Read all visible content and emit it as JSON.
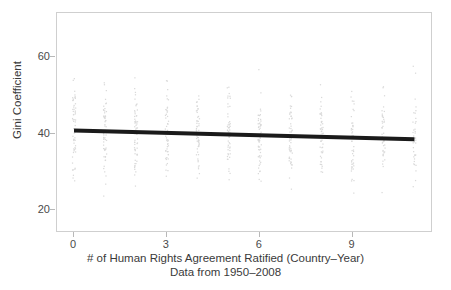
{
  "chart_data": {
    "type": "scatter",
    "title": "",
    "xlabel": "# of Human Rights Agreement Ratified (Country–Year)",
    "sublabel": "Data from 1950–2008",
    "ylabel": "Gini Coefficient",
    "xlim": [
      -0.55,
      11.6
    ],
    "ylim": [
      14.0,
      71.5
    ],
    "grid": false,
    "legend": false,
    "xticks": [
      0,
      3,
      6,
      9
    ],
    "xtick_labels": [
      "0",
      "3",
      "6",
      "9"
    ],
    "yticks": [
      20,
      40,
      60
    ],
    "ytick_labels": [
      "20",
      "40",
      "60"
    ],
    "point_color": "#d9d9d9",
    "line_color": "#1a1a1a",
    "frame_color": "#cfcfcf",
    "background": "#ffffff",
    "fit_line": {
      "name": "linear fit",
      "x": [
        0,
        11
      ],
      "y": [
        40.8,
        38.5
      ],
      "intercept": 40.8,
      "slope": -0.209,
      "width_px": 4
    },
    "series": [
      {
        "name": "Country-Year observations",
        "description": "Jittered vertical strips of observations at each integer count of ratified agreements",
        "columns": [
          {
            "x": 0,
            "n": 58,
            "y_min": 23.0,
            "y_max": 63.0,
            "y_median": 40.0,
            "y_q1": 33.0,
            "y_q3": 47.0
          },
          {
            "x": 1,
            "n": 62,
            "y_min": 22.0,
            "y_max": 62.5,
            "y_median": 40.0,
            "y_q1": 33.0,
            "y_q3": 47.0
          },
          {
            "x": 2,
            "n": 60,
            "y_min": 22.5,
            "y_max": 63.0,
            "y_median": 40.0,
            "y_q1": 33.0,
            "y_q3": 47.0
          },
          {
            "x": 3,
            "n": 55,
            "y_min": 17.5,
            "y_max": 60.5,
            "y_median": 39.5,
            "y_q1": 32.5,
            "y_q3": 46.5
          },
          {
            "x": 4,
            "n": 57,
            "y_min": 25.0,
            "y_max": 71.0,
            "y_median": 39.5,
            "y_q1": 32.5,
            "y_q3": 46.0
          },
          {
            "x": 5,
            "n": 54,
            "y_min": 20.5,
            "y_max": 62.0,
            "y_median": 39.5,
            "y_q1": 32.0,
            "y_q3": 46.0
          },
          {
            "x": 6,
            "n": 59,
            "y_min": 23.0,
            "y_max": 62.5,
            "y_median": 39.0,
            "y_q1": 32.0,
            "y_q3": 46.0
          },
          {
            "x": 7,
            "n": 52,
            "y_min": 22.5,
            "y_max": 65.0,
            "y_median": 39.0,
            "y_q1": 32.0,
            "y_q3": 45.5
          },
          {
            "x": 8,
            "n": 50,
            "y_min": 28.0,
            "y_max": 60.5,
            "y_median": 39.0,
            "y_q1": 32.5,
            "y_q3": 45.0
          },
          {
            "x": 9,
            "n": 46,
            "y_min": 24.0,
            "y_max": 62.0,
            "y_median": 38.5,
            "y_q1": 32.0,
            "y_q3": 45.0
          },
          {
            "x": 10,
            "n": 44,
            "y_min": 23.0,
            "y_max": 70.5,
            "y_median": 38.5,
            "y_q1": 32.0,
            "y_q3": 45.0
          },
          {
            "x": 11,
            "n": 40,
            "y_min": 24.5,
            "y_max": 69.0,
            "y_median": 38.5,
            "y_q1": 32.0,
            "y_q3": 44.5
          }
        ]
      }
    ]
  }
}
